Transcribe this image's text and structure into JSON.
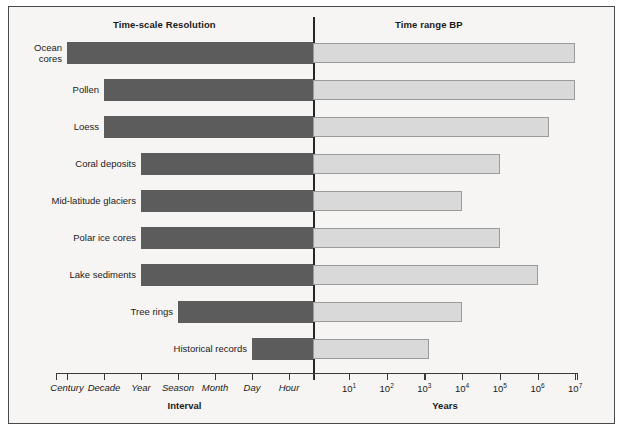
{
  "headers": {
    "left": "Time-scale Resolution",
    "right": "Time range BP"
  },
  "axes": {
    "left_title": "Interval",
    "right_title": "Years",
    "left_ticks": [
      "Century",
      "Decade",
      "Year",
      "Season",
      "Month",
      "Day",
      "Hour"
    ],
    "right_ticks": [
      "10",
      "10",
      "10",
      "10",
      "10",
      "10",
      "10"
    ],
    "right_tick_exponents": [
      "1",
      "2",
      "3",
      "4",
      "5",
      "6",
      "7"
    ]
  },
  "colors": {
    "resolution_bar": "#5c5c5c",
    "range_bar": "#d9d9d9",
    "range_bar_border": "#9b9b9b",
    "divider": "#262626",
    "background": "#f6f5f3",
    "frame": "#4a4a4a"
  },
  "chart_data": {
    "type": "bar",
    "orientation": "horizontal",
    "panels": [
      {
        "name": "Time-scale Resolution",
        "xlabel": "Interval",
        "scale": "ordinal-descending",
        "tick_labels": [
          "Century",
          "Decade",
          "Year",
          "Season",
          "Month",
          "Day",
          "Hour"
        ],
        "note": "Bars extend rightwards from their coarsest resolution to the central divider."
      },
      {
        "name": "Time range BP",
        "xlabel": "Years",
        "scale": "log10",
        "xlim": [
          1,
          10000000
        ],
        "tick_labels": [
          "10^1",
          "10^2",
          "10^3",
          "10^4",
          "10^5",
          "10^6",
          "10^7"
        ],
        "note": "Bars extend rightwards from the central divider to their maximum time range."
      }
    ],
    "categories": [
      "Ocean cores",
      "Pollen",
      "Loess",
      "Coral deposits",
      "Mid-latitude glaciers",
      "Polar ice cores",
      "Lake sediments",
      "Tree rings",
      "Historical records"
    ],
    "series": [
      {
        "name": "Time-scale Resolution (coarsest interval)",
        "values": [
          "Century",
          "Decade",
          "Decade",
          "Year",
          "Year",
          "Year",
          "Year",
          "Season",
          "Day"
        ]
      },
      {
        "name": "Time range BP (years)",
        "values": [
          10000000,
          10000000,
          2000000,
          100000,
          10000,
          100000,
          1000000,
          10000,
          1300
        ]
      }
    ],
    "grid": false,
    "legend": "none"
  },
  "rows": [
    {
      "label": "Ocean cores",
      "label_lines": [
        "Ocean",
        "cores"
      ],
      "resolution": "Century",
      "range_years": 10000000,
      "range_label": "10^7"
    },
    {
      "label": "Pollen",
      "label_lines": [
        "Pollen"
      ],
      "resolution": "Decade",
      "range_years": 10000000,
      "range_label": "10^7"
    },
    {
      "label": "Loess",
      "label_lines": [
        "Loess"
      ],
      "resolution": "Decade",
      "range_years": 2000000,
      "range_label": "2x10^6"
    },
    {
      "label": "Coral deposits",
      "label_lines": [
        "Coral deposits"
      ],
      "resolution": "Year",
      "range_years": 100000,
      "range_label": "10^5"
    },
    {
      "label": "Mid-latitude glaciers",
      "label_lines": [
        "Mid-latitude glaciers"
      ],
      "resolution": "Year",
      "range_years": 10000,
      "range_label": "10^4"
    },
    {
      "label": "Polar ice cores",
      "label_lines": [
        "Polar ice cores"
      ],
      "resolution": "Year",
      "range_years": 100000,
      "range_label": "10^5"
    },
    {
      "label": "Lake sediments",
      "label_lines": [
        "Lake sediments"
      ],
      "resolution": "Year",
      "range_years": 1000000,
      "range_label": "10^6"
    },
    {
      "label": "Tree rings",
      "label_lines": [
        "Tree rings"
      ],
      "resolution": "Season",
      "range_years": 10000,
      "range_label": "10^4"
    },
    {
      "label": "Historical records",
      "label_lines": [
        "Historical records"
      ],
      "resolution": "Day",
      "range_years": 1300,
      "range_label": "1.3x10^3"
    }
  ]
}
